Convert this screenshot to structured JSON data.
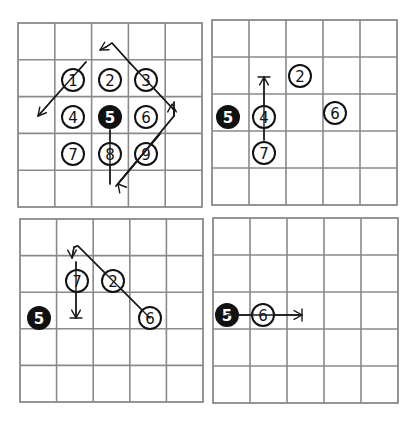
{
  "colors": {
    "grid": "#8a8a8a",
    "ink": "#111111",
    "background": "#ffffff"
  },
  "panels": [
    {
      "id": "panel-1",
      "grid": {
        "x0": 18,
        "y0": 23,
        "cols": 5,
        "rows": 5,
        "cell": 36.8
      },
      "stones": [
        {
          "label": "1",
          "cx": 73,
          "cy": 80,
          "filled": false
        },
        {
          "label": "2",
          "cx": 110,
          "cy": 80,
          "filled": false
        },
        {
          "label": "3",
          "cx": 146,
          "cy": 80,
          "filled": false
        },
        {
          "label": "4",
          "cx": 73,
          "cy": 117,
          "filled": false
        },
        {
          "label": "5",
          "cx": 110,
          "cy": 117,
          "filled": true
        },
        {
          "label": "6",
          "cx": 146,
          "cy": 117,
          "filled": false
        },
        {
          "label": "7",
          "cx": 73,
          "cy": 154,
          "filled": false
        },
        {
          "label": "8",
          "cx": 110,
          "cy": 154,
          "filled": false
        },
        {
          "label": "9",
          "cx": 146,
          "cy": 154,
          "filled": false
        }
      ],
      "paths": [
        {
          "points": [
            [
              110,
              130
            ],
            [
              110,
              184
            ]
          ],
          "end": "none"
        },
        {
          "points": [
            [
              116,
              186
            ],
            [
              174,
              116
            ],
            [
              174,
              110
            ],
            [
              130,
              63
            ]
          ],
          "end": "none"
        },
        {
          "points": [
            [
              118,
              184
            ],
            [
              160,
              134
            ]
          ],
          "end": "none"
        },
        {
          "points": [
            [
              174,
              116
            ],
            [
              174,
              102
            ]
          ],
          "end": "none"
        },
        {
          "points": [
            [
              130,
              63
            ],
            [
              112,
              43
            ],
            [
              106,
              47
            ]
          ],
          "end": "none"
        },
        {
          "points": [
            [
              86,
              62
            ],
            [
              38,
              116
            ]
          ],
          "end": "none"
        }
      ],
      "arrowheads": [
        {
          "x": 118,
          "y": 184,
          "angle": 230,
          "style": "open"
        },
        {
          "x": 172,
          "y": 104,
          "angle": 270,
          "style": "open"
        },
        {
          "x": 100,
          "y": 50,
          "angle": 150,
          "style": "open"
        },
        {
          "x": 38,
          "y": 116,
          "angle": 130,
          "style": "open"
        }
      ],
      "extra_lines": [
        {
          "points": [
            [
              106,
              47
            ],
            [
              100,
              50
            ]
          ]
        }
      ]
    },
    {
      "id": "panel-2",
      "grid": {
        "x0": 212,
        "y0": 20,
        "cols": 5,
        "rows": 5,
        "cell": 37
      },
      "stones": [
        {
          "label": "5",
          "cx": 228,
          "cy": 117,
          "filled": true
        },
        {
          "label": "4",
          "cx": 264,
          "cy": 117,
          "filled": false
        },
        {
          "label": "7",
          "cx": 264,
          "cy": 153,
          "filled": false
        },
        {
          "label": "2",
          "cx": 300,
          "cy": 76,
          "filled": false
        },
        {
          "label": "6",
          "cx": 335,
          "cy": 113,
          "filled": false
        }
      ],
      "paths": [
        {
          "points": [
            [
              264,
              140
            ],
            [
              264,
              77
            ]
          ],
          "end": "none"
        }
      ],
      "arrowheads": [
        {
          "x": 264,
          "y": 77,
          "angle": 270,
          "style": "tbar"
        }
      ]
    },
    {
      "id": "panel-3",
      "grid": {
        "x0": 20,
        "y0": 219,
        "cols": 5,
        "rows": 5,
        "cell": 36.6
      },
      "stones": [
        {
          "label": "5",
          "cx": 39,
          "cy": 318,
          "filled": true
        },
        {
          "label": "7",
          "cx": 77,
          "cy": 281,
          "filled": false
        },
        {
          "label": "2",
          "cx": 113,
          "cy": 281,
          "filled": false
        },
        {
          "label": "6",
          "cx": 150,
          "cy": 318,
          "filled": false
        }
      ],
      "paths": [
        {
          "points": [
            [
              150,
              318
            ],
            [
              78,
              246
            ],
            [
              74,
              247
            ],
            [
              72,
              258
            ]
          ],
          "end": "none"
        },
        {
          "points": [
            [
              76,
              262
            ],
            [
              76,
              318
            ]
          ],
          "end": "none"
        }
      ],
      "arrowheads": [
        {
          "x": 72,
          "y": 258,
          "angle": 90,
          "style": "open"
        },
        {
          "x": 76,
          "y": 318,
          "angle": 90,
          "style": "tbar"
        }
      ]
    },
    {
      "id": "panel-4",
      "grid": {
        "x0": 213,
        "y0": 218,
        "cols": 5,
        "rows": 5,
        "cell": 37
      },
      "stones": [
        {
          "label": "5",
          "cx": 227,
          "cy": 315,
          "filled": true
        },
        {
          "label": "6",
          "cx": 263,
          "cy": 315,
          "filled": false
        }
      ],
      "paths": [
        {
          "points": [
            [
              227,
              315
            ],
            [
              302,
              315
            ]
          ],
          "end": "none"
        }
      ],
      "arrowheads": [
        {
          "x": 302,
          "y": 315,
          "angle": 0,
          "style": "tbar"
        }
      ]
    }
  ]
}
